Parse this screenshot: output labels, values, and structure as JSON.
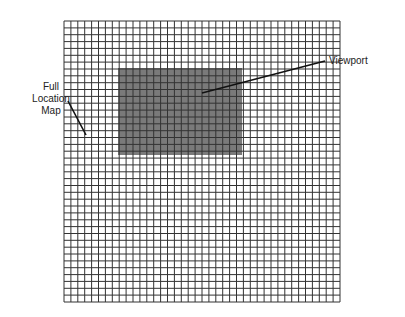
{
  "diagram": {
    "title": "",
    "labels": {
      "full_location_map_line1": "Full",
      "full_location_map_line2": "Location",
      "full_location_map_line3": "Map",
      "viewport": "Viewport"
    },
    "grid": {
      "x": 64,
      "y": 21,
      "width": 276,
      "height": 281,
      "cols": 40,
      "rows": 41,
      "line_color": "#333333"
    },
    "viewport_rect": {
      "x": 118,
      "y": 68,
      "width": 124,
      "height": 87,
      "fill": "#7a7a7a"
    },
    "leaders": [
      {
        "name": "full-location-map-leader",
        "x1": 68,
        "y1": 101,
        "x2": 86,
        "y2": 135
      },
      {
        "name": "viewport-leader",
        "x1": 202,
        "y1": 93,
        "x2": 325,
        "y2": 61
      }
    ]
  }
}
